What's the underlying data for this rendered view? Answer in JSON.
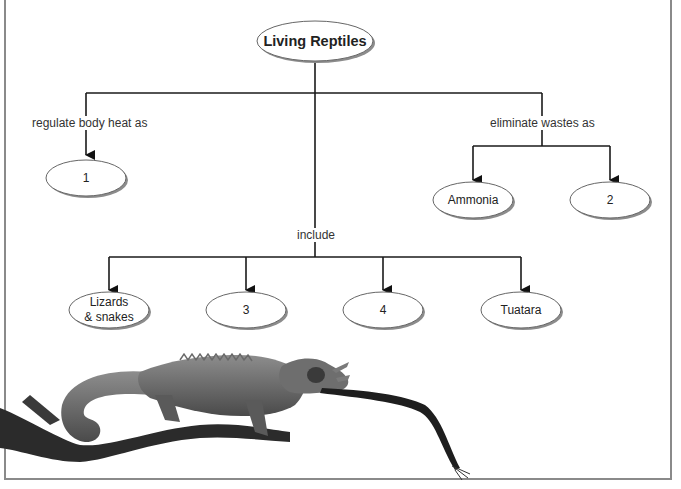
{
  "title": "Living Reptiles",
  "root": {
    "label": "Living Reptiles"
  },
  "branches": {
    "heat": {
      "link_label": "regulate body heat as",
      "nodes": [
        {
          "label": "1"
        }
      ]
    },
    "wastes": {
      "link_label": "eliminate wastes as",
      "nodes": [
        {
          "label": "Ammonia"
        },
        {
          "label": "2"
        }
      ]
    },
    "include": {
      "link_label": "include",
      "nodes": [
        {
          "label": "Lizards\n& snakes",
          "line1": "Lizards",
          "line2": "& snakes"
        },
        {
          "label": "3"
        },
        {
          "label": "4"
        },
        {
          "label": "Tuatara"
        }
      ]
    }
  },
  "illustration": {
    "subject": "chameleon on branch catching prey with tongue"
  },
  "colors": {
    "line": "#1a1a1a",
    "ellipse_border": "#555555",
    "ellipse_shadow": "#8c8c8c",
    "frame": "#8a8a8a"
  }
}
